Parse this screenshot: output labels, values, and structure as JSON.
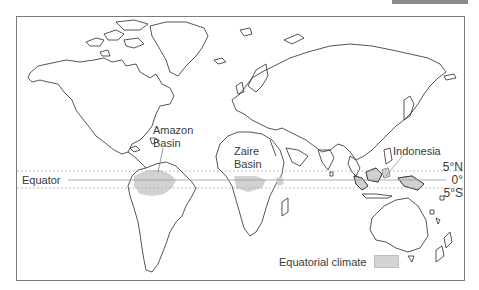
{
  "map": {
    "title": "Equatorial climate regions",
    "regions": [
      {
        "id": "amazon",
        "label_lines": [
          "Amazon",
          "Basin"
        ]
      },
      {
        "id": "zaire",
        "label_lines": [
          "Zaire",
          "Basin"
        ]
      },
      {
        "id": "indonesia",
        "label_lines": [
          "Indonesia"
        ]
      }
    ],
    "equator_label": "Equator",
    "latitudes": {
      "north": "5°N",
      "zero": "0°",
      "south": "5°S"
    },
    "legend": {
      "label": "Equatorial climate",
      "swatch_color": "#d4d4d4"
    },
    "colors": {
      "land_outline": "#2b2b2b",
      "shading": "#cfcfcf",
      "frame": "#7a7a7a",
      "lat_line": "#b0b0b0"
    }
  }
}
